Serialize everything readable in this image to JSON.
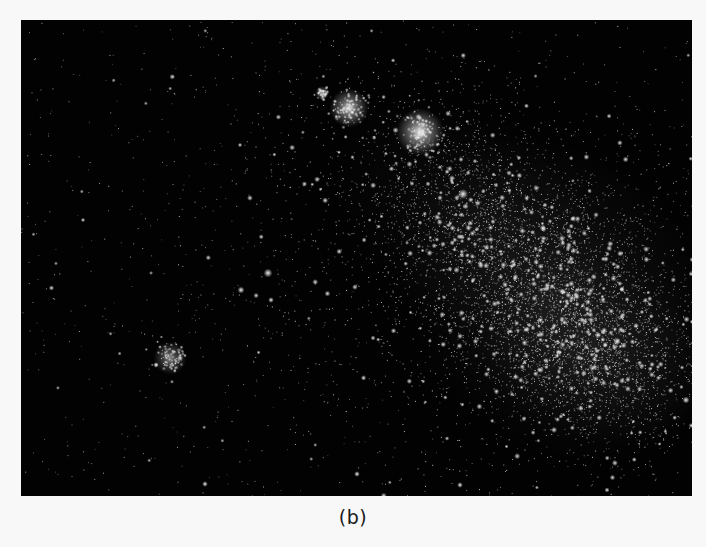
{
  "figure": {
    "caption": "(b)",
    "background_color": "#020202",
    "page_color": "#f8f8f8",
    "frame": {
      "x": 21,
      "y": 20,
      "width": 671,
      "height": 476
    }
  },
  "starfield": {
    "seed": 20240611,
    "background_star_count": 900,
    "density_regions": [
      {
        "name": "main-bar",
        "cx": 560,
        "cy": 300,
        "rx": 140,
        "ry": 110,
        "rotation_deg": 45,
        "count": 2600,
        "glow_alpha": 0.1
      },
      {
        "name": "southwest-wing",
        "cx": 590,
        "cy": 350,
        "rx": 95,
        "ry": 70,
        "rotation_deg": 20,
        "count": 1400,
        "glow_alpha": 0.08
      },
      {
        "name": "upper-extension",
        "cx": 470,
        "cy": 220,
        "rx": 120,
        "ry": 80,
        "rotation_deg": 35,
        "count": 1200,
        "glow_alpha": 0.05
      },
      {
        "name": "halo",
        "cx": 460,
        "cy": 250,
        "rx": 260,
        "ry": 200,
        "rotation_deg": 30,
        "count": 1500,
        "glow_alpha": 0.0
      }
    ],
    "clusters": [
      {
        "name": "globular-cluster-left",
        "x": 349,
        "y": 108,
        "radius": 14,
        "brightness": 0.85
      },
      {
        "name": "globular-cluster-right",
        "x": 420,
        "y": 132,
        "radius": 17,
        "brightness": 0.95
      },
      {
        "name": "small-cluster-top",
        "x": 322,
        "y": 93,
        "radius": 5,
        "brightness": 0.7
      },
      {
        "name": "star-group-lower-left",
        "x": 170,
        "y": 358,
        "radius": 12,
        "brightness": 0.55
      }
    ],
    "bright_stars": [
      {
        "x": 463,
        "y": 194,
        "size": 3.2
      },
      {
        "x": 268,
        "y": 273,
        "size": 2.8
      },
      {
        "x": 241,
        "y": 290,
        "size": 2.2
      },
      {
        "x": 271,
        "y": 300,
        "size": 1.8
      },
      {
        "x": 180,
        "y": 358,
        "size": 2.0
      },
      {
        "x": 156,
        "y": 365,
        "size": 1.8
      },
      {
        "x": 205,
        "y": 484,
        "size": 1.8
      },
      {
        "x": 357,
        "y": 474,
        "size": 1.8
      },
      {
        "x": 460,
        "y": 485,
        "size": 1.8
      },
      {
        "x": 607,
        "y": 490,
        "size": 1.6
      },
      {
        "x": 686,
        "y": 400,
        "size": 2.2
      },
      {
        "x": 598,
        "y": 335,
        "size": 2.0
      },
      {
        "x": 545,
        "y": 205,
        "size": 1.6
      },
      {
        "x": 83,
        "y": 220,
        "size": 1.4
      },
      {
        "x": 240,
        "y": 145,
        "size": 1.4
      }
    ]
  }
}
